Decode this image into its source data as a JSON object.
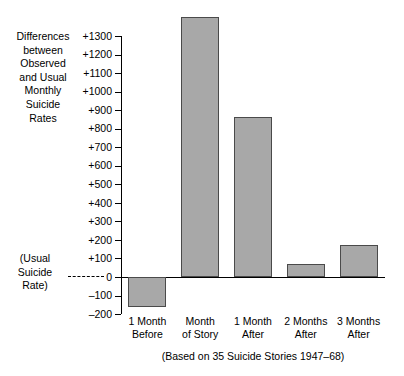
{
  "chart_data": {
    "type": "bar",
    "title": "",
    "ylabel": "Differences\nbetween\nObserved\nand Usual\nMonthly\nSuicide\nRates",
    "xlabel": "",
    "caption": "(Based on 35 Suicide Stories 1947–68)",
    "zero_annotation": "(Usual\nSuicide\nRate)",
    "categories": [
      "1 Month\nBefore",
      "Month\nof Story",
      "1 Month\nAfter",
      "2 Months\nAfter",
      "3 Months\nAfter"
    ],
    "values": [
      -160,
      1400,
      865,
      70,
      175
    ],
    "ylim": [
      -200,
      1400
    ],
    "ytick_values": [
      1300,
      1200,
      1100,
      1000,
      900,
      800,
      700,
      600,
      500,
      400,
      300,
      200,
      100,
      0,
      -100,
      -200
    ],
    "ytick_labels": [
      "+1300",
      "+1200",
      "+1100",
      "+1000",
      "+900",
      "+800",
      "+700",
      "+600",
      "+500",
      "+400",
      "+300",
      "+200",
      "+100",
      "0",
      "–100",
      "–200"
    ],
    "grid": false,
    "legend": false,
    "bar_color": "#a8a8a8",
    "bar_edge_color": "#4a4a4a",
    "axis_color": "#000000",
    "background": "#ffffff"
  }
}
